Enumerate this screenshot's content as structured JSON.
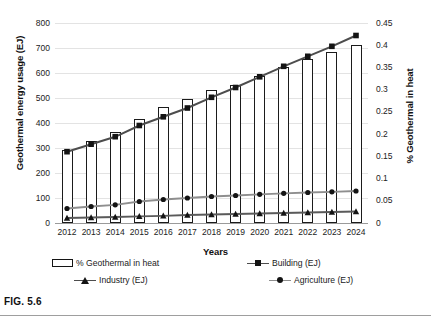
{
  "figure": {
    "caption": "FIG. 5.6"
  },
  "chart_data": {
    "type": "bar",
    "title": "",
    "xlabel": "Years",
    "ylabel": "Geothermal energy usage (EJ)",
    "y2label": "% Geothermal in heat",
    "categories": [
      "2012",
      "2013",
      "2014",
      "2015",
      "2016",
      "2017",
      "2018",
      "2019",
      "2020",
      "2021",
      "2022",
      "2023",
      "2024"
    ],
    "ylim": [
      0,
      800
    ],
    "y2lim": [
      0,
      0.45
    ],
    "yticks": [
      "0",
      "100",
      "200",
      "300",
      "400",
      "500",
      "600",
      "700",
      "800"
    ],
    "y2ticks": [
      "0",
      "0.05",
      "0.1",
      "0.15",
      "0.2",
      "0.25",
      "0.3",
      "0.35",
      "0.4",
      "0.45"
    ],
    "grid": true,
    "legend_position": "bottom",
    "series": [
      {
        "name": "% Geothermal in heat",
        "kind": "bar",
        "axis": "right",
        "values": [
          0.165,
          0.185,
          0.205,
          0.235,
          0.26,
          0.28,
          0.3,
          0.31,
          0.33,
          0.35,
          0.37,
          0.385,
          0.4
        ]
      },
      {
        "name": "Building (EJ)",
        "kind": "line",
        "marker": "square",
        "axis": "left",
        "values": [
          285,
          315,
          345,
          390,
          425,
          460,
          503,
          542,
          585,
          627,
          667,
          707,
          750
        ]
      },
      {
        "name": "Industry (EJ)",
        "kind": "line",
        "marker": "triangle",
        "axis": "left",
        "values": [
          20,
          22,
          24,
          27,
          29,
          32,
          34,
          36,
          38,
          40,
          42,
          44,
          46
        ]
      },
      {
        "name": "Agriculture (EJ)",
        "kind": "line",
        "marker": "circle",
        "axis": "left",
        "values": [
          58,
          66,
          73,
          86,
          94,
          100,
          106,
          110,
          115,
          119,
          122,
          125,
          128
        ]
      }
    ],
    "colors": {
      "bar_outline": "#1b1b1b",
      "bar_fill": "#ffffff",
      "building_line": "#4d4d4d",
      "industry_line": "#5a5a5a",
      "agriculture_line": "#8e8e8e",
      "grid": "#e3e3e3",
      "axis": "#9a9a9a"
    }
  },
  "legend": {
    "items": [
      {
        "label": "% Geothermal in heat"
      },
      {
        "label": "Building (EJ)"
      },
      {
        "label": "Industry (EJ)"
      },
      {
        "label": "Agriculture (EJ)"
      }
    ]
  }
}
